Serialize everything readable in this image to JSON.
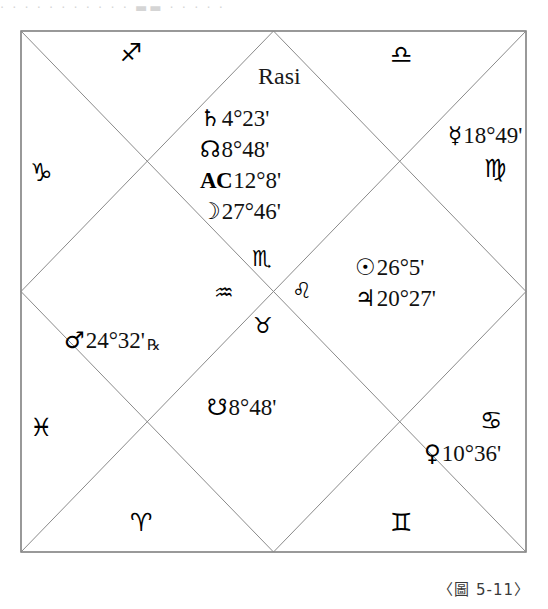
{
  "scan_artifact": "· · ·   · · · · · · · ·  ▬▬  · · · · ·",
  "figure": {
    "title": "Rasi",
    "caption": "〈圖 5-11〉",
    "type": "north-indian-vedic-rasi-chart"
  },
  "signs": {
    "sagittarius": "♐",
    "libra": "♎",
    "capricorn": "♑",
    "virgo": "♍",
    "scorpio": "♏",
    "aquarius": "♒",
    "leo": "♌",
    "taurus": "♉",
    "pisces": "♓",
    "cancer": "♋",
    "aries": "♈",
    "gemini": "♊"
  },
  "placements": {
    "saturn": {
      "glyph": "♄",
      "degree": "4°23'",
      "retrograde": ""
    },
    "north_node": {
      "glyph": "☊",
      "degree": "8°48'",
      "retrograde": ""
    },
    "ascendant": {
      "glyph": "AC",
      "degree": "12°8'",
      "retrograde": ""
    },
    "moon": {
      "glyph": "☽",
      "degree": "27°46'",
      "retrograde": ""
    },
    "mercury": {
      "glyph": "☿",
      "degree": "18°49'",
      "retrograde": ""
    },
    "sun": {
      "glyph": "☉",
      "degree": "26°5'",
      "retrograde": ""
    },
    "jupiter": {
      "glyph": "♃",
      "degree": "20°27'",
      "retrograde": ""
    },
    "mars": {
      "glyph": "♂",
      "degree": "24°32'",
      "retrograde": "℞"
    },
    "south_node": {
      "glyph": "☋",
      "degree": "8°48'",
      "retrograde": ""
    },
    "venus": {
      "glyph": "♀",
      "degree": "10°36'",
      "retrograde": ""
    }
  },
  "colors": {
    "line": "#8a8a8a",
    "border": "#6e6e6e",
    "text": "#111111",
    "background": "#ffffff"
  }
}
